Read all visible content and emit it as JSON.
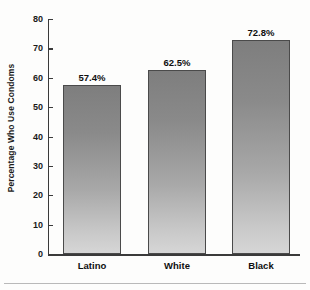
{
  "chart_data": {
    "type": "bar",
    "title": "",
    "xlabel": "",
    "ylabel": "Percentage Who Use Condoms",
    "categories": [
      "Latino",
      "White",
      "Black"
    ],
    "values": [
      57.4,
      62.5,
      72.8
    ],
    "data_labels": [
      "57.4%",
      "62.5%",
      "72.8%"
    ],
    "ylim": [
      0,
      80
    ],
    "yticks": [
      0,
      10,
      20,
      30,
      40,
      50,
      60,
      70,
      80
    ],
    "ytick_labels": [
      "0",
      "10",
      "20",
      "30",
      "40",
      "50",
      "60",
      "70",
      "80"
    ],
    "grid": false,
    "legend": false,
    "legend_position": "none",
    "series": [
      {
        "name": "Percentage Who Use Condoms",
        "values": [
          57.4,
          62.5,
          72.8
        ]
      }
    ]
  },
  "style": {
    "bar_fill_top": "#7e7e7e",
    "bar_fill_bottom": "#d6d6d6",
    "bar_border": "#4a4a4a",
    "axis_color": "#3a3a3a",
    "text_color": "#0f0f0f",
    "background": "#fdfdfc"
  }
}
